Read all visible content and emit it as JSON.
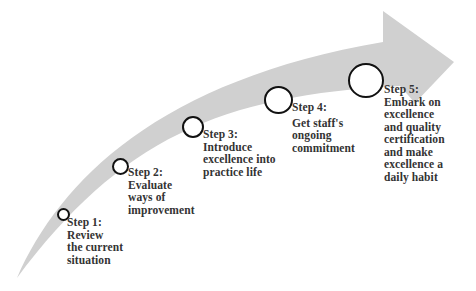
{
  "diagram": {
    "type": "curved-process-arrow",
    "arrow_color": "#d0d0d0",
    "circle_stroke": "#111111",
    "text_color": "#333333"
  },
  "steps": [
    {
      "title": "Step 1:",
      "desc": "Review\nthe current\nsituation"
    },
    {
      "title": "Step 2:",
      "desc": "Evaluate\nways of\nimprovement"
    },
    {
      "title": "Step 3:",
      "desc": "Introduce\nexcellence into\npractice life"
    },
    {
      "title": "Step 4:",
      "desc": "Get staff's\nongoing\ncommitment"
    },
    {
      "title": "Step 5:",
      "desc": "Embark on\nexcellence\nand quality\ncertification\nand make\nexcellence a\ndaily habit"
    }
  ]
}
